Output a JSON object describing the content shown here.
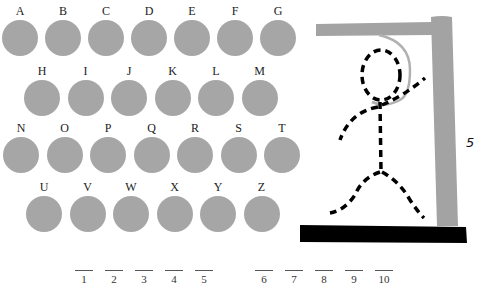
{
  "game": {
    "title": "Hangman",
    "wrong_guesses": "5",
    "colors": {
      "letter_circle": "#a6a6a6",
      "gallows": "#a3a3a3",
      "base": "#000000",
      "figure": "#000000",
      "rope": "#b0b0b0"
    }
  },
  "keyboard": {
    "rows": [
      [
        "A",
        "B",
        "C",
        "D",
        "E",
        "F",
        "G"
      ],
      [
        "H",
        "I",
        "J",
        "K",
        "L",
        "M"
      ],
      [
        "N",
        "O",
        "P",
        "Q",
        "R",
        "S",
        "T"
      ],
      [
        "U",
        "V",
        "W",
        "X",
        "Y",
        "Z"
      ]
    ]
  },
  "slots": [
    "1",
    "2",
    "3",
    "4",
    "5",
    "6",
    "7",
    "8",
    "9",
    "10"
  ]
}
